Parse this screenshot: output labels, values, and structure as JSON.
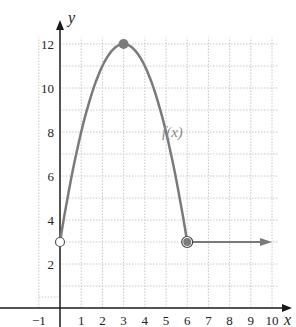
{
  "chart_data": {
    "type": "line",
    "title": "",
    "xlabel": "x",
    "ylabel": "y",
    "function_label": "f(x)",
    "xlim": [
      -1,
      10
    ],
    "ylim": [
      0,
      12
    ],
    "grid": true,
    "x_ticks": [
      "−1",
      "1",
      "2",
      "3",
      "4",
      "5",
      "6",
      "7",
      "8",
      "9",
      "10"
    ],
    "y_ticks": [
      "2",
      "4",
      "6",
      "8",
      "10",
      "12"
    ],
    "segments": [
      {
        "kind": "parabola",
        "x_range": [
          0,
          6
        ],
        "points": [
          [
            0,
            3
          ],
          [
            1,
            8
          ],
          [
            2,
            11
          ],
          [
            3,
            12
          ],
          [
            4,
            11
          ],
          [
            5,
            8
          ],
          [
            6,
            3
          ]
        ]
      },
      {
        "kind": "horizontal_ray",
        "from": [
          6,
          3
        ],
        "to": [
          10,
          3
        ],
        "arrow": true
      }
    ],
    "special_points": [
      {
        "x": 0,
        "y": 3,
        "style": "open"
      },
      {
        "x": 3,
        "y": 12,
        "style": "closed"
      },
      {
        "x": 6,
        "y": 3,
        "style": "closed-with-open-ring"
      }
    ],
    "colors": {
      "curve": "#7a7a7a",
      "axes": "#1a1a1a",
      "grid": "#c8c8c8"
    }
  }
}
